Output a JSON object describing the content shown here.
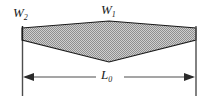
{
  "diagram": {
    "kind": "engineering-dimension-diagram",
    "colors": {
      "fill": "#a8a8a8",
      "outline": "#1a1a1a",
      "dimension_line": "#4d4d4d",
      "background": "#ffffff",
      "text": "#1a1a1a"
    },
    "labels": {
      "center_width": {
        "symbol": "W",
        "subscript": "1"
      },
      "end_width": {
        "symbol": "W",
        "subscript": "2"
      },
      "length": {
        "symbol": "L",
        "subscript": "0"
      }
    },
    "geometry": {
      "left_x": 22,
      "right_x": 196,
      "mid_x": 109,
      "top_vertex_y": 21,
      "bottom_vertex_y": 62,
      "left_end_top_y": 28,
      "left_end_bottom_y": 40,
      "right_end_top_y": 28,
      "right_end_bottom_y": 40,
      "dimension_line_y": 77,
      "extension_line_bottom_y": 96,
      "extension_line_top_y": 26
    }
  }
}
